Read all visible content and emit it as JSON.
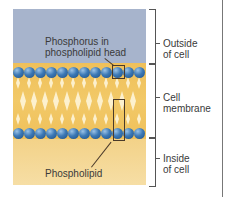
{
  "diagram": {
    "labels": {
      "phosphorus_line1": "Phosphorus in",
      "phosphorus_line2": "phospholipid head",
      "phospholipid": "Phospholipid"
    },
    "regions": [
      {
        "id": "outside",
        "line1": "Outside",
        "line2": "of cell"
      },
      {
        "id": "membrane",
        "line1": "Cell",
        "line2": "membrane"
      },
      {
        "id": "inside",
        "line1": "Inside",
        "line2": "of cell"
      }
    ],
    "colors": {
      "outside": "#a7b4cc",
      "membrane": "#efc05a",
      "inside": "#f3d288",
      "head": "#3c79b6"
    },
    "head_count_per_row": 12
  }
}
